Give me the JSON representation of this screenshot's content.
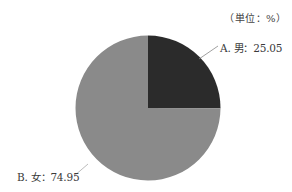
{
  "unit_label": "（単位：%）",
  "labels": {
    "a": "A. 男：25.05",
    "b": "B. 女：74.95"
  },
  "chart_data": {
    "type": "pie",
    "title": "",
    "unit": "%",
    "categories": [
      "A. 男",
      "B. 女"
    ],
    "values": [
      25.05,
      74.95
    ],
    "colors": [
      "#2b2b2b",
      "#8a8a8a"
    ],
    "start_angle": "12 o'clock, clockwise",
    "legend": "none (leader-line labels)"
  }
}
